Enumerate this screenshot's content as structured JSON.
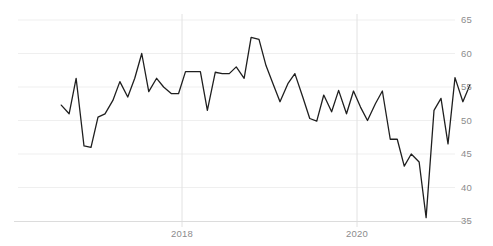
{
  "chart_data": {
    "type": "line",
    "title": "",
    "subtitle": "",
    "xlabel": "",
    "ylabel": "",
    "grid": true,
    "grid_axis": "both",
    "legend": false,
    "legend_position": "none",
    "ylim": [
      33.5,
      66.5
    ],
    "yticks": [
      35,
      40,
      45,
      50,
      55,
      60,
      65
    ],
    "ytick_labels": [
      "35",
      "40",
      "45",
      "50",
      "55",
      "60",
      "65"
    ],
    "xticks": [
      2018,
      2020
    ],
    "xtick_labels": [
      "2018",
      "2020"
    ],
    "xlim": [
      2016.55,
      2021.85
    ],
    "line_color": "#1f1f1f",
    "line_width": 1.3,
    "grid_color": "#ededed",
    "axis_color": "#d8d8d8",
    "tick_label_color": "#8c8c8c",
    "series": [
      {
        "name": "PMI",
        "x": [
          2016.62,
          2016.71,
          2016.79,
          2016.88,
          2016.96,
          2017.04,
          2017.12,
          2017.21,
          2017.29,
          2017.38,
          2017.46,
          2017.54,
          2017.62,
          2017.71,
          2017.79,
          2017.88,
          2017.96,
          2018.04,
          2018.12,
          2018.21,
          2018.29,
          2018.38,
          2018.46,
          2018.54,
          2018.62,
          2018.71,
          2018.79,
          2018.88,
          2018.96,
          2019.04,
          2019.12,
          2019.21,
          2019.29,
          2019.38,
          2019.46,
          2019.54,
          2019.62,
          2019.71,
          2019.79,
          2019.88,
          2019.96,
          2020.04,
          2020.12,
          2020.21,
          2020.29,
          2020.38,
          2020.46,
          2020.54,
          2020.62,
          2020.71,
          2020.79,
          2020.88,
          2020.96,
          2021.04,
          2021.12,
          2021.21,
          2021.29
        ],
        "values": [
          52.3,
          51.0,
          56.3,
          46.2,
          46.0,
          50.5,
          51.0,
          53.0,
          55.8,
          53.5,
          56.3,
          60.0,
          54.3,
          56.3,
          55.0,
          54.0,
          54.0,
          57.3,
          57.3,
          57.3,
          51.5,
          57.2,
          57.0,
          57.0,
          58.0,
          56.3,
          62.4,
          62.1,
          58.2,
          55.5,
          52.8,
          55.5,
          57.0,
          53.5,
          50.3,
          49.9,
          53.8,
          51.3,
          54.5,
          51.0,
          54.4,
          52.0,
          50.0,
          52.5,
          54.4,
          47.2,
          47.2,
          43.2,
          45.0,
          43.8,
          35.5,
          51.5,
          53.3,
          46.5,
          56.4,
          52.8,
          55.3
        ]
      }
    ],
    "annotations": []
  },
  "axis": {
    "y_labels": [
      {
        "text": "65",
        "value": 65
      },
      {
        "text": "60",
        "value": 60
      },
      {
        "text": "55",
        "value": 55
      },
      {
        "text": "50",
        "value": 50
      },
      {
        "text": "45",
        "value": 45
      },
      {
        "text": "40",
        "value": 40
      },
      {
        "text": "35",
        "value": 35
      }
    ],
    "x_labels": [
      {
        "text": "2018",
        "value": 2018
      },
      {
        "text": "2020",
        "value": 2020
      }
    ]
  }
}
